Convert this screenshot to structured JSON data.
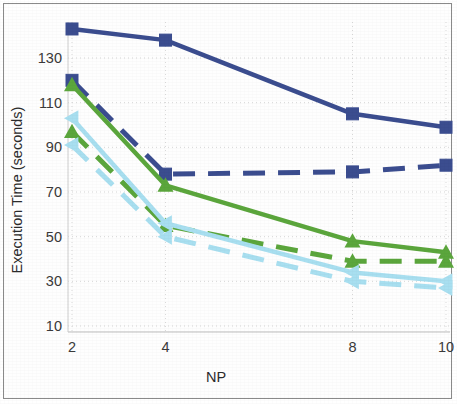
{
  "chart_data": {
    "type": "line",
    "title": "",
    "xlabel": "NP",
    "ylabel": "Execution Time (seconds)",
    "x": [
      2,
      4,
      8,
      10
    ],
    "xtick_labels": [
      "2",
      "4",
      "8",
      "10"
    ],
    "ytick_labels": [
      "10",
      "30",
      "50",
      "70",
      "90",
      "110",
      "130"
    ],
    "yticks": [
      10,
      30,
      50,
      70,
      90,
      110,
      130
    ],
    "ylim": [
      0,
      150
    ],
    "xlim": [
      1.55,
      10.4
    ],
    "grid": true,
    "legend": "none",
    "series": [
      {
        "name": "dark-blue-solid-square",
        "color": "#3b4d8f",
        "style": "solid",
        "marker": "square",
        "values": [
          143,
          138,
          105,
          99
        ]
      },
      {
        "name": "dark-blue-dashed-square",
        "color": "#3b4d8f",
        "style": "dashed",
        "marker": "square",
        "values": [
          120,
          78,
          79,
          82
        ]
      },
      {
        "name": "green-solid-triangle",
        "color": "#5ba63c",
        "style": "solid",
        "marker": "triangle",
        "values": [
          118,
          73,
          48,
          43
        ]
      },
      {
        "name": "green-dashed-triangle",
        "color": "#5ba63c",
        "style": "dashed",
        "marker": "triangle",
        "values": [
          97,
          55,
          39,
          39
        ]
      },
      {
        "name": "light-blue-solid-triangle",
        "color": "#a8dff0",
        "style": "solid",
        "marker": "triangle-left",
        "values": [
          103,
          56,
          34,
          30
        ]
      },
      {
        "name": "light-blue-dashed-triangle",
        "color": "#a8dff0",
        "style": "dashed",
        "marker": "triangle-left",
        "values": [
          91,
          50,
          30,
          27
        ]
      }
    ]
  },
  "colors": {
    "dark_blue": "#3b4d8f",
    "green": "#5ba63c",
    "light_blue": "#a8dff0",
    "grid": "#d9d9d9",
    "frame": "#8a8a8a",
    "text": "#2b2b2b"
  }
}
